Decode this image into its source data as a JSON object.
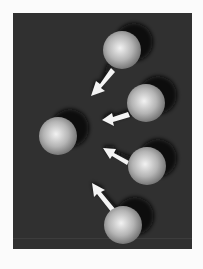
{
  "scene": {
    "background": "#fbfbfb",
    "panel_color": "#303030",
    "sphere_light": "#f0f0f0",
    "sphere_dark": "#6a6a6a",
    "arrow_color": "#f4f4f4",
    "shadow_color": "#080808",
    "spheres": [
      {
        "id": "sphere-top",
        "cx": 122,
        "cy": 50,
        "r": 19
      },
      {
        "id": "sphere-right-upper",
        "cx": 146,
        "cy": 103,
        "r": 19
      },
      {
        "id": "sphere-center-target",
        "cx": 58,
        "cy": 136,
        "r": 19
      },
      {
        "id": "sphere-right-lower",
        "cx": 147,
        "cy": 166,
        "r": 19
      },
      {
        "id": "sphere-bottom",
        "cx": 123,
        "cy": 225,
        "r": 19
      }
    ],
    "arrows": [
      {
        "from": "sphere-top",
        "direction": "down-left"
      },
      {
        "from": "sphere-right-upper",
        "direction": "left"
      },
      {
        "from": "sphere-right-lower",
        "direction": "up-left"
      },
      {
        "from": "sphere-bottom",
        "direction": "up-left"
      }
    ]
  }
}
